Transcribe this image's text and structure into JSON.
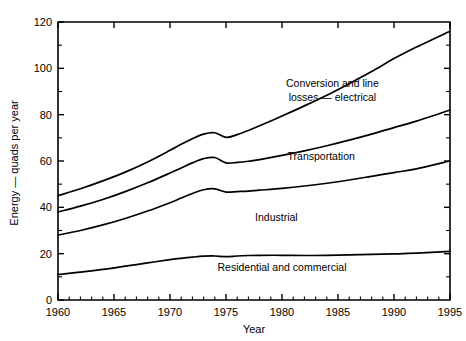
{
  "chart_data": {
    "type": "line",
    "title": "",
    "xlabel": "Year",
    "ylabel": "Energy — quads per year",
    "xlim": [
      1960,
      1995
    ],
    "ylim": [
      0,
      120
    ],
    "grid": false,
    "legend_position": "inline-annotations",
    "x_ticks_major": [
      1960,
      1965,
      1970,
      1975,
      1980,
      1985,
      1990,
      1995
    ],
    "x_ticks_minor": [
      1961,
      1962,
      1963,
      1964,
      1966,
      1967,
      1968,
      1969,
      1971,
      1972,
      1973,
      1974,
      1976,
      1977,
      1978,
      1979,
      1981,
      1982,
      1983,
      1984,
      1986,
      1987,
      1988,
      1989,
      1991,
      1992,
      1993,
      1994
    ],
    "y_ticks_major": [
      0,
      20,
      40,
      60,
      80,
      100,
      120
    ],
    "y_ticks_minor": [
      10,
      30,
      50,
      70,
      90,
      110
    ],
    "x_tick_labels": [
      "1960",
      "1965",
      "1970",
      "1975",
      "1980",
      "1985",
      "1990",
      "1995"
    ],
    "y_tick_labels": [
      "0",
      "20",
      "40",
      "60",
      "80",
      "100",
      "120"
    ],
    "x": [
      1960,
      1962,
      1964,
      1966,
      1968,
      1970,
      1971,
      1972,
      1973,
      1974,
      1975,
      1976,
      1977,
      1978,
      1980,
      1982,
      1984,
      1986,
      1988,
      1990,
      1992,
      1995
    ],
    "series": [
      {
        "name": "Residential and commercial",
        "values": [
          11.0,
          12.0,
          13.2,
          14.6,
          16.0,
          17.4,
          18.0,
          18.5,
          18.9,
          19.0,
          18.7,
          19.0,
          19.2,
          19.3,
          19.3,
          19.2,
          19.3,
          19.5,
          19.7,
          19.9,
          20.2,
          21.0
        ]
      },
      {
        "name": "Industrial",
        "values": [
          28.0,
          30.0,
          32.4,
          35.2,
          38.4,
          42.0,
          44.0,
          46.0,
          47.6,
          48.0,
          46.6,
          46.8,
          47.0,
          47.4,
          48.2,
          49.2,
          50.4,
          51.8,
          53.4,
          55.0,
          56.6,
          60.0
        ]
      },
      {
        "name": "Transportation",
        "values": [
          38.0,
          40.5,
          43.4,
          46.8,
          50.6,
          54.8,
          57.0,
          59.2,
          61.0,
          61.5,
          59.2,
          59.4,
          59.9,
          60.6,
          62.4,
          64.4,
          66.6,
          69.0,
          71.6,
          74.4,
          77.2,
          82.0
        ]
      },
      {
        "name": "Conversion and line losses — electrical",
        "values": [
          45.0,
          48.0,
          51.4,
          55.2,
          59.6,
          64.6,
          67.2,
          69.6,
          71.6,
          72.2,
          70.2,
          71.4,
          73.2,
          75.2,
          79.4,
          83.8,
          88.4,
          93.4,
          98.6,
          104.2,
          109.2,
          116.0
        ]
      }
    ],
    "annotations": [
      {
        "text_line1": "Conversion and line",
        "text_line2": "losses — electrical",
        "x": 1984.5,
        "y": 92.0
      },
      {
        "text_line1": "Transportation",
        "text_line2": "",
        "x": 1983.5,
        "y": 60.5
      },
      {
        "text_line1": "Industrial",
        "text_line2": "",
        "x": 1979.5,
        "y": 34.0
      },
      {
        "text_line1": "Residential and commercial",
        "text_line2": "",
        "x": 1980.0,
        "y": 12.5
      }
    ]
  },
  "colors": {
    "axis": "#000000",
    "curve": "#000000",
    "background": "#ffffff"
  }
}
